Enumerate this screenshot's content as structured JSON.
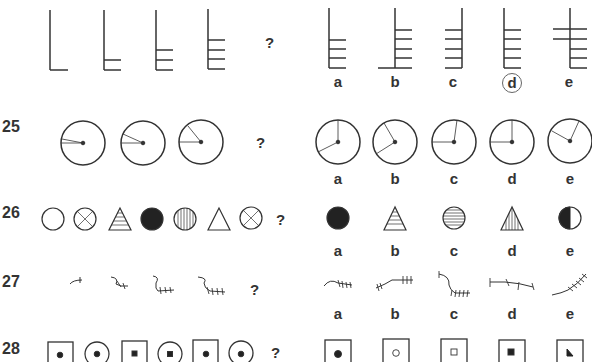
{
  "questions": [
    {
      "number": "",
      "question_mark": "?",
      "sequence_desc": [
        "L-bar 0 rungs",
        "L-bar 1 rung",
        "L-bar 2 rungs",
        "L-bar 3 rungs"
      ],
      "options": [
        {
          "label": "a",
          "desc": "vertical with 3 right rungs at bottom"
        },
        {
          "label": "b",
          "desc": "vertical with foot extending left and 4 right rungs"
        },
        {
          "label": "c",
          "desc": "vertical with 5 left rungs"
        },
        {
          "label": "d",
          "desc": "vertical with 5 right rungs",
          "circled": true
        },
        {
          "label": "e",
          "desc": "crossed vertical with 2 through-bars and 3 right rungs"
        }
      ]
    },
    {
      "number": "25",
      "question_mark": "?",
      "sequence_desc": [
        "circle with narrow angle",
        "circle with wider angle",
        "circle with wider angle"
      ],
      "options": [
        {
          "label": "a"
        },
        {
          "label": "b"
        },
        {
          "label": "c"
        },
        {
          "label": "d"
        },
        {
          "label": "e"
        }
      ]
    },
    {
      "number": "26",
      "question_mark": "?",
      "sequence_desc": [
        "empty circle",
        "crossed circle",
        "horizontal-striped triangle",
        "filled circle",
        "vertical-striped circle",
        "empty triangle",
        "crossed circle"
      ],
      "options": [
        {
          "label": "a",
          "desc": "filled circle"
        },
        {
          "label": "b",
          "desc": "horizontal-striped triangle"
        },
        {
          "label": "c",
          "desc": "horizontal-striped circle"
        },
        {
          "label": "d",
          "desc": "vertical-striped triangle"
        },
        {
          "label": "e",
          "desc": "half-filled circle"
        }
      ]
    },
    {
      "number": "27",
      "question_mark": "?",
      "sequence_desc": [
        "squiggle 1 tick",
        "squiggle 2 ticks",
        "squiggle 3 ticks",
        "squiggle 4 ticks"
      ],
      "options": [
        {
          "label": "a"
        },
        {
          "label": "b"
        },
        {
          "label": "c"
        },
        {
          "label": "d"
        },
        {
          "label": "e"
        }
      ]
    },
    {
      "number": "28",
      "question_mark": "?",
      "sequence_desc": [
        "square w/ dot",
        "circle w/ dot",
        "square w/ small square",
        "circle w/ small square",
        "square w/ dot",
        "circle w/ dot"
      ],
      "options": [
        {
          "label": "a",
          "desc": "square with filled dot"
        },
        {
          "label": "b",
          "desc": "square with hollow circle"
        },
        {
          "label": "c",
          "desc": "square with hollow square"
        },
        {
          "label": "d",
          "desc": "square with filled square"
        },
        {
          "label": "e",
          "desc": "square with triangle"
        }
      ]
    }
  ]
}
